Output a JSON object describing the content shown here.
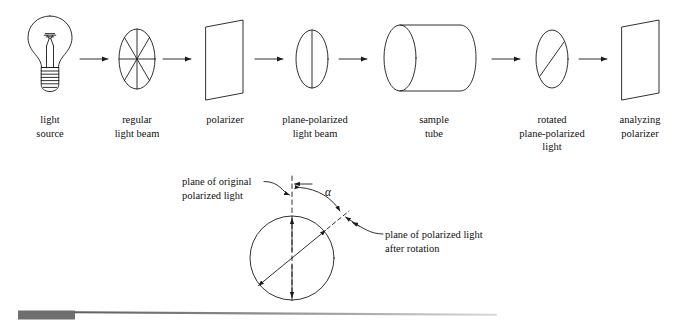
{
  "diagram": {
    "stroke_color": "#1a1a1a",
    "fill_color": "#ffffff",
    "rule_color": "#6f6f6f"
  },
  "stages": [
    {
      "id": "light-source",
      "icon": "light-bulb-icon",
      "label": "light\nsource"
    },
    {
      "id": "regular-light-beam",
      "icon": "unpolarized-beam-ellipse-icon",
      "label": "regular\nlight beam"
    },
    {
      "id": "polarizer",
      "icon": "polarizer-plate-icon",
      "label": "polarizer"
    },
    {
      "id": "plane-polarized-beam",
      "icon": "plane-polarized-ellipse-icon",
      "label": "plane-polarized\nlight beam"
    },
    {
      "id": "sample-tube",
      "icon": "cylinder-tube-icon",
      "label": "sample\ntube"
    },
    {
      "id": "rotated-polarized-light",
      "icon": "rotated-polarized-ellipse-icon",
      "label": "rotated\nplane-polarized\nlight"
    },
    {
      "id": "analyzing-polarizer",
      "icon": "polarizer-plate-icon",
      "label": "analyzing\npolarizer"
    }
  ],
  "arrows": {
    "count": 6,
    "icon": "right-arrow-icon",
    "direction": "right"
  },
  "rotation_detail": {
    "original_plane_label": "plane of original\npolarized light",
    "rotated_plane_label": "plane of polarized light\nafter rotation",
    "angle_symbol": "α",
    "original_plane_icon": "dashed-vertical-axis-icon",
    "rotated_plane_icon": "solid-diagonal-axis-icon",
    "angle_arc_icon": "angle-arc-icon",
    "circle_icon": "circle-outline-icon"
  },
  "footer_rule": {
    "icon": "decorative-rule-icon",
    "block_label": "",
    "line_label": ""
  }
}
